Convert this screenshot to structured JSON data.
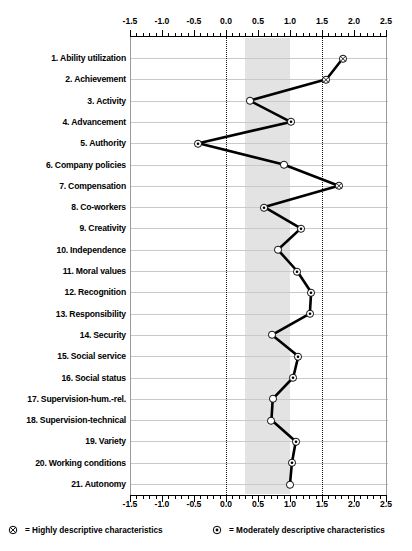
{
  "chart_data": {
    "type": "line",
    "title": "",
    "xlabel": "",
    "ylabel": "",
    "orientation": "horizontal",
    "xlim": [
      -1.5,
      2.5
    ],
    "xticks": [
      -1.5,
      -1.0,
      -0.5,
      0.0,
      0.5,
      1.0,
      1.5,
      2.0,
      2.5
    ],
    "xticklabels": [
      "-1.5",
      "-1.0",
      "-0.5",
      "0.0",
      "0.5",
      "1.0",
      "1.5",
      "2.0",
      "2.5"
    ],
    "minor_tick_step": 0.1,
    "grid": true,
    "reference_lines": [
      0.0,
      1.5
    ],
    "shaded_band": [
      0.3,
      1.0
    ],
    "axis_top": true,
    "axis_bottom": true,
    "categories": [
      "Ability utilization",
      "Achievement",
      "Activity",
      "Advancement",
      "Authority",
      "Company policies",
      "Compensation",
      "Co-workers",
      "Creativity",
      "Independence",
      "Moral values",
      "Recognition",
      "Responsibility",
      "Security",
      "Social service",
      "Social status",
      "Supervision-hum.-rel.",
      "Supervision-technical",
      "Variety",
      "Working conditions",
      "Autonomy"
    ],
    "values": [
      1.83,
      1.57,
      0.37,
      1.01,
      -0.43,
      0.9,
      1.76,
      0.6,
      1.17,
      0.81,
      1.11,
      1.33,
      1.31,
      0.72,
      1.13,
      1.05,
      0.73,
      0.71,
      1.09,
      1.03,
      1.0
    ],
    "marker_types": [
      "highly",
      "highly",
      "open",
      "moderately",
      "moderately",
      "open",
      "highly",
      "moderately",
      "moderately",
      "open",
      "moderately",
      "moderately",
      "moderately",
      "open",
      "moderately",
      "moderately",
      "open",
      "open",
      "moderately",
      "moderately",
      "open"
    ],
    "legend": [
      {
        "symbol": "highly",
        "text": "= Highly descriptive characteristics"
      },
      {
        "symbol": "moderately",
        "text": "= Moderately descriptive characteristics"
      }
    ],
    "legend_position": "bottom"
  },
  "colors": {
    "band": "#e3e3e3",
    "grid": "#c9c9c9",
    "line": "#000000",
    "axis": "#000000",
    "reference": "#111111"
  }
}
